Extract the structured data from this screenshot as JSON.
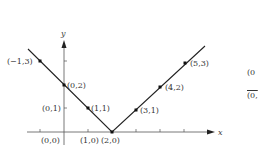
{
  "diagram": {
    "type": "graph-of-absolute-value-function",
    "axes": {
      "x_label": "x",
      "y_label": "y"
    },
    "points": [
      {
        "label": "(−1,3)",
        "x": -1,
        "y": 3
      },
      {
        "label": "(0,2)",
        "x": 0,
        "y": 2
      },
      {
        "label": "(1,1)",
        "x": 1,
        "y": 1
      },
      {
        "label": "(2,0)",
        "x": 2,
        "y": 0
      },
      {
        "label": "(3,1)",
        "x": 3,
        "y": 1
      },
      {
        "label": "(4,2)",
        "x": 4,
        "y": 2
      },
      {
        "label": "(5,3)",
        "x": 5,
        "y": 3
      }
    ],
    "axis_tick_labels": {
      "y_tick": "(0,1)",
      "x_ticks": [
        "(0,0)",
        "(1,0)"
      ]
    },
    "right_partial_text": {
      "top": "(0",
      "bottom": "(0,"
    },
    "colors": {
      "line": "#222222",
      "axis": "#555555",
      "text": "#333333"
    }
  }
}
